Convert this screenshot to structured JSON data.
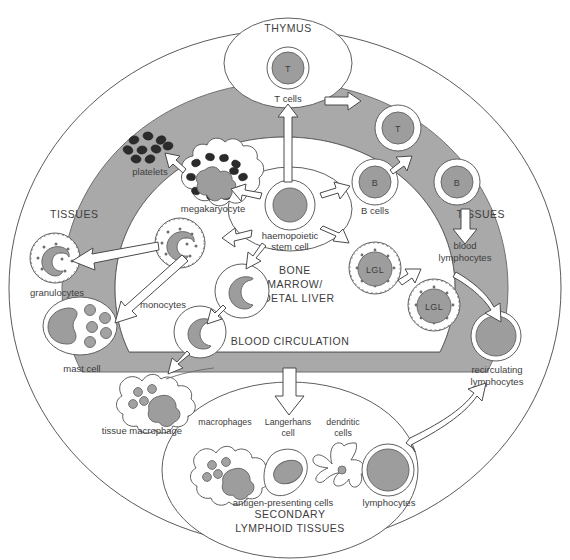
{
  "figure": {
    "background_color": "#ffffff",
    "ring_color": "#a9a9a9",
    "cell_fill_color": "#9d9d9d",
    "line_color": "#5a5a5a",
    "text_color": "#3d3d3d"
  },
  "regions": {
    "thymus": "THYMUS",
    "tissues_left": "TISSUES",
    "tissues_right": "TISSUES",
    "bone_marrow": "BONE\nMARROW/\nFOETAL LIVER",
    "bone_marrow_line1": "BONE",
    "bone_marrow_line2": "MARROW/",
    "bone_marrow_line3": "FOETAL LIVER",
    "blood_circulation": "BLOOD CIRCULATION",
    "secondary_line1": "SECONDARY",
    "secondary_line2": "LYMPHOID TISSUES"
  },
  "cells": {
    "thymus_t": {
      "mark": "T",
      "label": "T cells"
    },
    "blood_t": {
      "mark": "T"
    },
    "marrow_b": {
      "mark": "B",
      "label": "B cells"
    },
    "blood_b": {
      "mark": "B"
    },
    "marrow_lgl": {
      "mark": "LGL"
    },
    "blood_lgl": {
      "mark": "LGL"
    },
    "stem_cell": {
      "label_line1": "haemopoietic",
      "label_line2": "stem cell"
    },
    "platelets": {
      "label": "platelets"
    },
    "megakaryocyte": {
      "label": "megakaryocyte"
    },
    "granulocyte_marrow": {
      "label": ""
    },
    "granulocytes": {
      "label": "granulocytes"
    },
    "monocytes": {
      "label": "monocytes"
    },
    "mast_cell": {
      "label": "mast cell"
    },
    "tissue_macrophage": {
      "label": "tissue macrophage"
    },
    "blood_lymphocytes": {
      "label_line1": "blood",
      "label_line2": "lymphocytes"
    },
    "recirculating": {
      "label_line1": "recirculating",
      "label_line2": "lymphocytes"
    }
  },
  "secondary_lymphoid": {
    "apc_labels": {
      "macrophages": "macrophages",
      "langerhans_line1": "Langerhans",
      "langerhans_line2": "cell",
      "dendritic_line1": "dendritic",
      "dendritic_line2": "cells"
    },
    "group_label": "antigen-presenting cells",
    "lymphocytes_label": "lymphocytes"
  },
  "flow_arrows": [
    {
      "name": "stem-to-thymus",
      "from": "haemopoietic stem cell",
      "to": "THYMUS"
    },
    {
      "name": "thymus-to-blood",
      "from": "THYMUS",
      "to": "BLOOD CIRCULATION"
    },
    {
      "name": "stem-to-megakaryocyte",
      "from": "haemopoietic stem cell",
      "to": "megakaryocyte"
    },
    {
      "name": "megakaryocyte-to-platelets",
      "from": "megakaryocyte",
      "to": "platelets"
    },
    {
      "name": "stem-to-granulocyte",
      "from": "haemopoietic stem cell",
      "to": "granulocyte"
    },
    {
      "name": "granulocyte-to-tissues",
      "from": "granulocyte",
      "to": "TISSUES"
    },
    {
      "name": "stem-to-monocyte",
      "from": "haemopoietic stem cell",
      "to": "monocytes"
    },
    {
      "name": "monocyte-to-mast-cell",
      "from": "monocytes",
      "to": "mast cell"
    },
    {
      "name": "monocyte-to-tissue-macrophage",
      "from": "monocytes",
      "to": "tissue macrophage"
    },
    {
      "name": "stem-to-b-cell",
      "from": "haemopoietic stem cell",
      "to": "B cells"
    },
    {
      "name": "b-cell-to-blood",
      "from": "B cells",
      "to": "BLOOD CIRCULATION"
    },
    {
      "name": "stem-to-lgl",
      "from": "haemopoietic stem cell",
      "to": "LGL"
    },
    {
      "name": "lgl-to-blood",
      "from": "LGL",
      "to": "BLOOD CIRCULATION"
    },
    {
      "name": "blood-b-to-lymphocytes",
      "from": "B",
      "to": "blood lymphocytes"
    },
    {
      "name": "blood-to-recirculating",
      "from": "BLOOD CIRCULATION",
      "to": "recirculating lymphocytes"
    },
    {
      "name": "blood-to-secondary",
      "from": "BLOOD CIRCULATION",
      "to": "SECONDARY LYMPHOID TISSUES"
    },
    {
      "name": "secondary-to-tissues",
      "from": "SECONDARY LYMPHOID TISSUES",
      "to": "TISSUES",
      "bidirectional": true
    }
  ]
}
